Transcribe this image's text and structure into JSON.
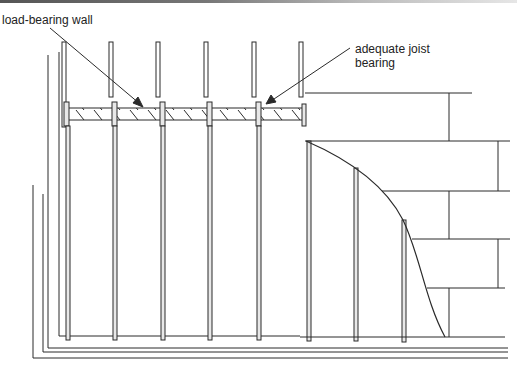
{
  "diagram": {
    "labels": {
      "load_bearing_wall": "load-bearing wall",
      "adequate_joist_bearing": "adequate joist\nbearing"
    },
    "colors": {
      "line": "#2a2a2a",
      "stud_fill": "#e8e8e8",
      "background": "#ffffff"
    },
    "elements": {
      "studs_upper_count": 6,
      "studs_lower_count": 8,
      "joist_hatch": true,
      "brick_courses_visible": 5,
      "floor_lines": 3
    }
  }
}
